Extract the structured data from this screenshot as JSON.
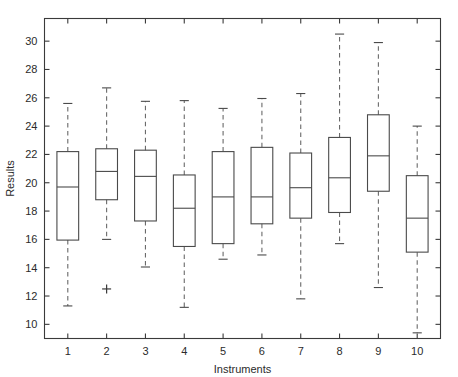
{
  "chart_data": {
    "type": "boxplot",
    "title": "",
    "xlabel": "Instruments",
    "ylabel": "Results",
    "categories": [
      "1",
      "2",
      "3",
      "4",
      "5",
      "6",
      "7",
      "8",
      "9",
      "10"
    ],
    "xlim": [
      0.4,
      10.6
    ],
    "ylim": [
      9.0,
      31.6
    ],
    "yticks": [
      10,
      12,
      14,
      16,
      18,
      20,
      22,
      24,
      26,
      28,
      30
    ],
    "ytick_labels": [
      "10",
      "12",
      "14",
      "16",
      "18",
      "20",
      "22",
      "24",
      "26",
      "28",
      "30"
    ],
    "xticks": [
      1,
      2,
      3,
      4,
      5,
      6,
      7,
      8,
      9,
      10
    ],
    "xtick_labels": [
      "1",
      "2",
      "3",
      "4",
      "5",
      "6",
      "7",
      "8",
      "9",
      "10"
    ],
    "grid": false,
    "legend": null,
    "box_width": 0.56,
    "boxes": [
      {
        "category": "1",
        "position": 1,
        "whisker_low": 11.3,
        "q1": 15.95,
        "median": 19.7,
        "q3": 22.2,
        "whisker_high": 25.6,
        "outliers": []
      },
      {
        "category": "2",
        "position": 2,
        "whisker_low": 16.0,
        "q1": 18.8,
        "median": 20.8,
        "q3": 22.4,
        "whisker_high": 26.7,
        "outliers": [
          12.5
        ]
      },
      {
        "category": "3",
        "position": 3,
        "whisker_low": 14.05,
        "q1": 17.3,
        "median": 20.45,
        "q3": 22.3,
        "whisker_high": 25.75,
        "outliers": []
      },
      {
        "category": "4",
        "position": 4,
        "whisker_low": 11.2,
        "q1": 15.5,
        "median": 18.2,
        "q3": 20.55,
        "whisker_high": 25.8,
        "outliers": []
      },
      {
        "category": "5",
        "position": 5,
        "whisker_low": 14.6,
        "q1": 15.7,
        "median": 19.0,
        "q3": 22.2,
        "whisker_high": 25.25,
        "outliers": []
      },
      {
        "category": "6",
        "position": 6,
        "whisker_low": 14.9,
        "q1": 17.1,
        "median": 19.0,
        "q3": 22.5,
        "whisker_high": 25.95,
        "outliers": []
      },
      {
        "category": "7",
        "position": 7,
        "whisker_low": 11.8,
        "q1": 17.5,
        "median": 19.65,
        "q3": 22.1,
        "whisker_high": 26.3,
        "outliers": []
      },
      {
        "category": "8",
        "position": 8,
        "whisker_low": 15.7,
        "q1": 17.9,
        "median": 20.35,
        "q3": 23.2,
        "whisker_high": 30.5,
        "outliers": []
      },
      {
        "category": "9",
        "position": 9,
        "whisker_low": 12.6,
        "q1": 19.4,
        "median": 21.9,
        "q3": 24.8,
        "whisker_high": 29.9,
        "outliers": []
      },
      {
        "category": "10",
        "position": 10,
        "whisker_low": 9.4,
        "q1": 15.1,
        "median": 17.5,
        "q3": 20.5,
        "whisker_high": 24.0,
        "outliers": []
      }
    ]
  },
  "figure": {
    "background_color": "#ffffff",
    "axis_color": "#3a3a3a",
    "box_color": "#4a4a4a",
    "whisker_color": "#6a6a6a",
    "outlier_color": "#3a3a3a"
  }
}
